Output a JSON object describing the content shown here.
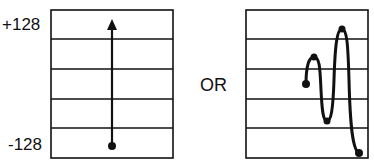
{
  "labels": {
    "top_value": "+128",
    "bottom_value": "-128",
    "separator": "OR"
  },
  "colors": {
    "stroke": "#111111",
    "background": "#ffffff"
  },
  "left_panel": {
    "description": "straight upward path from bottom dot to top arrow",
    "box": {
      "x": 51,
      "y": 10,
      "width": 122,
      "height": 148
    },
    "gridlines_y": [
      39,
      69,
      99,
      128
    ],
    "start_point": {
      "x": 112,
      "y": 146
    },
    "end_arrow_tip": {
      "x": 112,
      "y": 20
    }
  },
  "right_panel": {
    "description": "oscillating path with loops ending at bottom",
    "box": {
      "x": 246,
      "y": 10,
      "width": 122,
      "height": 148
    },
    "gridlines_y": [
      39,
      69,
      99,
      128
    ],
    "points": [
      {
        "x": 306,
        "y": 84
      },
      {
        "x": 314,
        "y": 57
      },
      {
        "x": 327,
        "y": 121
      },
      {
        "x": 342,
        "y": 29
      },
      {
        "x": 359,
        "y": 153
      }
    ]
  }
}
